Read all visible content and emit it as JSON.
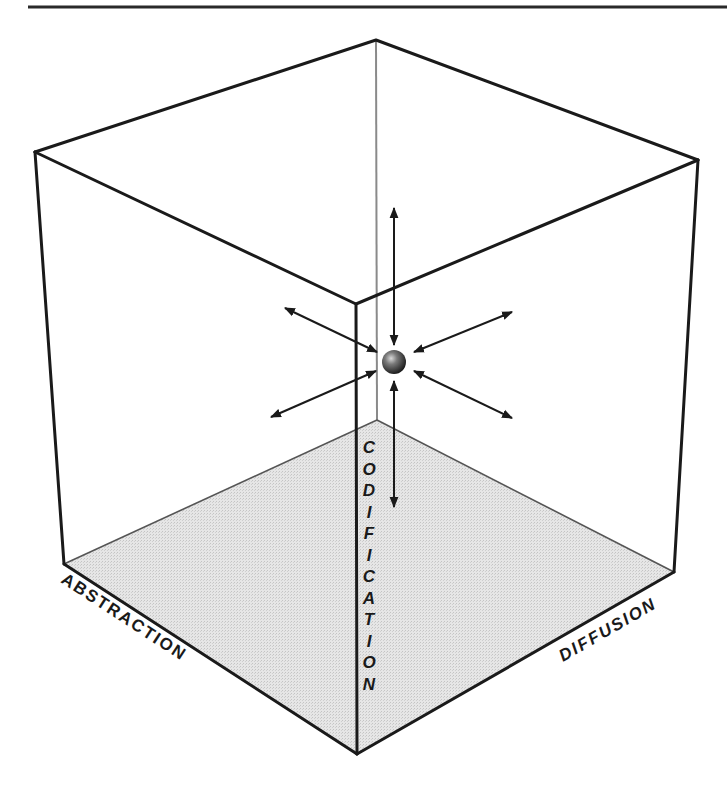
{
  "figure": {
    "type": "3d-cube-diagram",
    "axes": {
      "left": "ABSTRACTION",
      "right": "DIFFUSION",
      "vertical": "CODIFICATION"
    },
    "center_object": "sphere",
    "arrows": [
      {
        "direction": "up"
      },
      {
        "direction": "down"
      },
      {
        "direction": "upper-left"
      },
      {
        "direction": "lower-left"
      },
      {
        "direction": "upper-right"
      },
      {
        "direction": "lower-right"
      }
    ],
    "colors": {
      "line": "#1a1a1a",
      "back_edge": "#8a8a8a",
      "floor": "#e3e3e3",
      "background": "#ffffff"
    }
  },
  "vertical_letters": [
    "C",
    "O",
    "D",
    "I",
    "F",
    "I",
    "C",
    "A",
    "T",
    "I",
    "O",
    "N"
  ]
}
